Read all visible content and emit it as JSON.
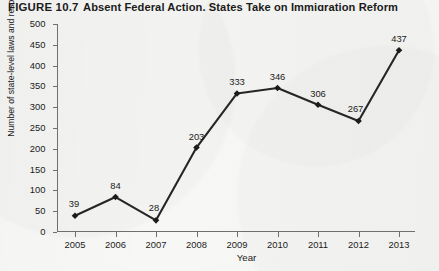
{
  "figure": {
    "number": "FIGURE 10.7",
    "title": "Absent Federal Action, States Take on Immigration Reform"
  },
  "axes": {
    "ylabel": "Number of state-level laws and resolutions adopted",
    "xlabel": "Year"
  },
  "colors": {
    "line": "#262626",
    "marker": "#1b1b1b",
    "axis": "#6f6f6f",
    "text": "#1b1b1b",
    "background": "#f7f7f5"
  },
  "chart_data": {
    "type": "line",
    "title": "Absent Federal Action, States Take on Immigration Reform",
    "xlabel": "Year",
    "ylabel": "Number of state-level laws and resolutions adopted",
    "categories": [
      "2005",
      "2006",
      "2007",
      "2008",
      "2009",
      "2010",
      "2011",
      "2012",
      "2013"
    ],
    "values": [
      39,
      84,
      28,
      203,
      333,
      346,
      306,
      267,
      437
    ],
    "point_labels": [
      "39",
      "84",
      "28",
      "203",
      "333",
      "346",
      "306",
      "267",
      "437"
    ],
    "ylim": [
      0,
      500
    ],
    "yticks": [
      0,
      50,
      100,
      150,
      200,
      250,
      300,
      350,
      400,
      450,
      500
    ],
    "ytick_labels": [
      "0",
      "50",
      "100",
      "150",
      "200",
      "250",
      "300",
      "350",
      "400",
      "450",
      "500"
    ],
    "xtick_labels": [
      "2005",
      "2006",
      "2007",
      "2008",
      "2009",
      "2010",
      "2011",
      "2012",
      "2013"
    ],
    "grid": false,
    "legend": null,
    "marker": "diamond"
  }
}
